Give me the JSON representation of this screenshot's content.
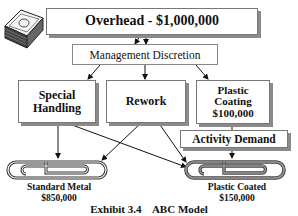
{
  "diagram": {
    "overhead": {
      "label": "Overhead - $1,000,000",
      "icon": "money-stack-icon"
    },
    "discretion": {
      "label": "Management Discretion"
    },
    "activities": [
      {
        "line1": "Special",
        "line2": "Handling",
        "line3": ""
      },
      {
        "line1": "Rework",
        "line2": "",
        "line3": ""
      },
      {
        "line1": "Plastic",
        "line2": "Coating",
        "line3": "$100,000"
      }
    ],
    "activity_demand": {
      "label": "Activity Demand"
    },
    "products": [
      {
        "name": "Standard Metal",
        "value": "$850,000",
        "icon": "paperclip-icon"
      },
      {
        "name": "Plastic Coated",
        "value": "$150,000",
        "icon": "paperclip-icon"
      }
    ],
    "caption": "Exhibit 3.4    ABC Model"
  }
}
